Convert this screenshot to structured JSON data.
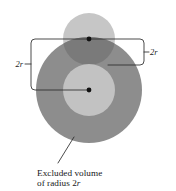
{
  "figure": {
    "caption": {
      "line1": "Excluded volume",
      "line2_prefix": "of radius 2",
      "line2_symbol": "r"
    },
    "labels": {
      "top_right_dimension": "2r",
      "left_dimension": "2r"
    },
    "colors": {
      "background": "#ffffff",
      "excluded_volume_fill": "#8d8d8d",
      "molecule_fill": "#c2c2c2",
      "upper_sphere_fill": "#c6c6c6",
      "overlap_fill": "#7a7a7a",
      "line_stroke": "#2a2a2a",
      "dot_fill": "#111111"
    },
    "geometry": {
      "excluded_circle": {
        "cx": 89,
        "cy": 90,
        "r": 53
      },
      "molecule_circle": {
        "cx": 89,
        "cy": 90,
        "r": 26
      },
      "upper_circle": {
        "cx": 89,
        "cy": 39,
        "r": 26
      },
      "upper_center_dot": {
        "cx": 89,
        "cy": 39,
        "r": 2.3
      },
      "lower_center_dot": {
        "cx": 89,
        "cy": 90,
        "r": 2.3
      }
    }
  }
}
